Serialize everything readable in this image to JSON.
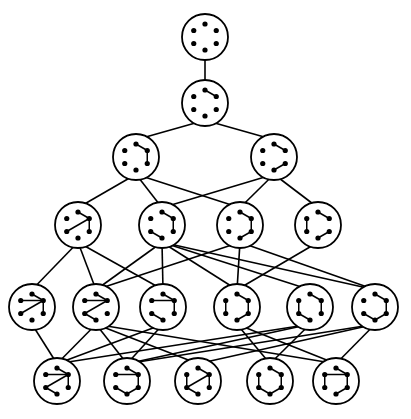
{
  "diagram": {
    "title": "",
    "type": "hasse-diagram-of-graphs",
    "node_radius": 23,
    "vertex_radius": 2.6,
    "inner_radius": 13,
    "stroke_color": "#000000",
    "background": "#ffffff",
    "vertex_order": [
      "top",
      "upper-right",
      "lower-right",
      "bottom",
      "lower-left",
      "upper-left"
    ],
    "nodes": [
      {
        "id": "L1",
        "x": 205,
        "y": 37,
        "edges": []
      },
      {
        "id": "L2",
        "x": 205,
        "y": 103,
        "edges": [
          [
            0,
            1
          ]
        ]
      },
      {
        "id": "L3a",
        "x": 136,
        "y": 157,
        "edges": [
          [
            0,
            1
          ],
          [
            1,
            2
          ]
        ]
      },
      {
        "id": "L3b",
        "x": 274,
        "y": 157,
        "edges": [
          [
            0,
            1
          ],
          [
            2,
            3
          ]
        ]
      },
      {
        "id": "L4a",
        "x": 78,
        "y": 225,
        "edges": [
          [
            0,
            1
          ],
          [
            1,
            2
          ],
          [
            1,
            4
          ]
        ]
      },
      {
        "id": "L4b",
        "x": 162,
        "y": 225,
        "edges": [
          [
            0,
            1
          ],
          [
            1,
            2
          ],
          [
            4,
            3
          ]
        ]
      },
      {
        "id": "L4c",
        "x": 240,
        "y": 225,
        "edges": [
          [
            0,
            1
          ],
          [
            1,
            2
          ],
          [
            2,
            3
          ]
        ]
      },
      {
        "id": "L4d",
        "x": 318,
        "y": 225,
        "edges": [
          [
            0,
            1
          ],
          [
            5,
            4
          ],
          [
            2,
            3
          ]
        ]
      },
      {
        "id": "L5a",
        "x": 32,
        "y": 307,
        "edges": [
          [
            0,
            1
          ],
          [
            5,
            1
          ],
          [
            4,
            1
          ],
          [
            1,
            2
          ]
        ]
      },
      {
        "id": "L5b",
        "x": 96,
        "y": 307,
        "edges": [
          [
            0,
            1
          ],
          [
            5,
            1
          ],
          [
            1,
            4
          ],
          [
            4,
            3
          ]
        ]
      },
      {
        "id": "L5c",
        "x": 163,
        "y": 307,
        "edges": [
          [
            0,
            1
          ],
          [
            5,
            1
          ],
          [
            1,
            2
          ],
          [
            4,
            3
          ]
        ]
      },
      {
        "id": "L5d",
        "x": 237,
        "y": 307,
        "edges": [
          [
            0,
            1
          ],
          [
            1,
            2
          ],
          [
            2,
            3
          ],
          [
            5,
            4
          ]
        ]
      },
      {
        "id": "L5e",
        "x": 310,
        "y": 307,
        "edges": [
          [
            0,
            1
          ],
          [
            1,
            2
          ],
          [
            5,
            4
          ],
          [
            4,
            3
          ]
        ]
      },
      {
        "id": "L5f",
        "x": 375,
        "y": 307,
        "edges": [
          [
            0,
            1
          ],
          [
            1,
            2
          ],
          [
            2,
            3
          ],
          [
            3,
            4
          ]
        ]
      },
      {
        "id": "L6a",
        "x": 57,
        "y": 381,
        "edges": [
          [
            0,
            1
          ],
          [
            5,
            1
          ],
          [
            1,
            4
          ],
          [
            1,
            2
          ],
          [
            4,
            3
          ]
        ]
      },
      {
        "id": "L6b",
        "x": 127,
        "y": 381,
        "edges": [
          [
            0,
            1
          ],
          [
            5,
            1
          ],
          [
            1,
            2
          ],
          [
            2,
            3
          ],
          [
            4,
            3
          ]
        ]
      },
      {
        "id": "L6c",
        "x": 198,
        "y": 381,
        "edges": [
          [
            0,
            1
          ],
          [
            1,
            4
          ],
          [
            1,
            2
          ],
          [
            5,
            4
          ],
          [
            4,
            3
          ]
        ]
      },
      {
        "id": "L6d",
        "x": 270,
        "y": 381,
        "edges": [
          [
            0,
            1
          ],
          [
            1,
            2
          ],
          [
            2,
            3
          ],
          [
            3,
            4
          ],
          [
            4,
            5
          ]
        ]
      },
      {
        "id": "L6e",
        "x": 336,
        "y": 381,
        "edges": [
          [
            0,
            1
          ],
          [
            5,
            1
          ],
          [
            5,
            4
          ],
          [
            1,
            2
          ],
          [
            2,
            3
          ]
        ]
      }
    ],
    "links": [
      [
        "L1",
        "L2"
      ],
      [
        "L2",
        "L3a"
      ],
      [
        "L2",
        "L3b"
      ],
      [
        "L3a",
        "L4a"
      ],
      [
        "L3a",
        "L4b"
      ],
      [
        "L3a",
        "L4c"
      ],
      [
        "L3b",
        "L4b"
      ],
      [
        "L3b",
        "L4c"
      ],
      [
        "L3b",
        "L4d"
      ],
      [
        "L4a",
        "L5a"
      ],
      [
        "L4a",
        "L5b"
      ],
      [
        "L4a",
        "L5c"
      ],
      [
        "L4b",
        "L5b"
      ],
      [
        "L4b",
        "L5c"
      ],
      [
        "L4b",
        "L5d"
      ],
      [
        "L4b",
        "L5e"
      ],
      [
        "L4b",
        "L5f"
      ],
      [
        "L4c",
        "L5b"
      ],
      [
        "L4c",
        "L5d"
      ],
      [
        "L4c",
        "L5f"
      ],
      [
        "L4d",
        "L5d"
      ],
      [
        "L5a",
        "L6a"
      ],
      [
        "L5b",
        "L6a"
      ],
      [
        "L5b",
        "L6b"
      ],
      [
        "L5b",
        "L6c"
      ],
      [
        "L5b",
        "L6e"
      ],
      [
        "L5c",
        "L6a"
      ],
      [
        "L5c",
        "L6b"
      ],
      [
        "L5d",
        "L6d"
      ],
      [
        "L5d",
        "L6e"
      ],
      [
        "L5e",
        "L6a"
      ],
      [
        "L5e",
        "L6b"
      ],
      [
        "L5e",
        "L6d"
      ],
      [
        "L5f",
        "L6b"
      ],
      [
        "L5f",
        "L6c"
      ],
      [
        "L5f",
        "L6e"
      ]
    ]
  }
}
